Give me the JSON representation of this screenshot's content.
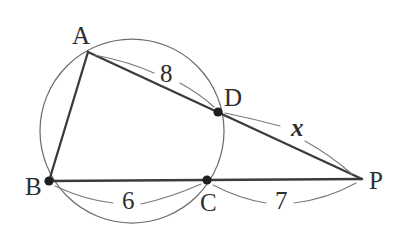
{
  "figure": {
    "background_color": "#ffffff",
    "line_color": "#3b3b3b",
    "circle_color": "#6d6d6d",
    "leader_color": "#7a7a7a",
    "dot_color": "#1f1f1f"
  },
  "circle": {
    "center_x": 132,
    "center_y": 131,
    "radius": 92
  },
  "points": [
    {
      "id": "A",
      "label": "A",
      "x": 88,
      "y": 52,
      "label_x": 72,
      "label_y": 44,
      "has_dot": false,
      "on_circle": true
    },
    {
      "id": "B",
      "label": "B",
      "x": 49,
      "y": 181,
      "label_x": 25,
      "label_y": 195,
      "has_dot": true,
      "on_circle": true
    },
    {
      "id": "C",
      "label": "C",
      "x": 207,
      "y": 180,
      "label_x": 200,
      "label_y": 211,
      "has_dot": true,
      "on_circle": true
    },
    {
      "id": "D",
      "label": "D",
      "x": 218,
      "y": 112,
      "label_x": 224,
      "label_y": 106,
      "has_dot": true,
      "on_circle": true
    },
    {
      "id": "P",
      "label": "P",
      "x": 362,
      "y": 179,
      "label_x": 369,
      "label_y": 189,
      "has_dot": false,
      "on_circle": false
    }
  ],
  "segments": [
    {
      "id": "AB",
      "from": "A",
      "to": "B",
      "x1": 88,
      "y1": 52,
      "x2": 49,
      "y2": 181
    },
    {
      "id": "AP",
      "from": "A",
      "to": "P",
      "x1": 88,
      "y1": 52,
      "x2": 362,
      "y2": 179
    },
    {
      "id": "BP",
      "from": "B",
      "to": "P",
      "x1": 49,
      "y1": 181,
      "x2": 362,
      "y2": 179
    }
  ],
  "measures": [
    {
      "id": "AD",
      "label": "8",
      "x": 160,
      "y": 82,
      "italic": false,
      "segment": "A to D"
    },
    {
      "id": "DP",
      "label": "x",
      "x": 291,
      "y": 136,
      "italic": true,
      "segment": "D to P"
    },
    {
      "id": "BC",
      "label": "6",
      "x": 122,
      "y": 209,
      "italic": false,
      "segment": "B to C"
    },
    {
      "id": "CP",
      "label": "7",
      "x": 275,
      "y": 209,
      "italic": false,
      "segment": "C to P"
    }
  ],
  "leader_arcs": [
    {
      "id": "arc-A-to-8",
      "d": "M 95 55 Q 130 62 154 73"
    },
    {
      "id": "arc-8-to-D",
      "d": "M 180 83 Q 200 94 214 107"
    },
    {
      "id": "arc-D-to-x",
      "d": "M 225 113 Q 254 119 280 126"
    },
    {
      "id": "arc-x-to-P",
      "d": "M 305 141 Q 330 155 352 174"
    },
    {
      "id": "arc-B-to-6",
      "d": "M 55 186 Q 85 200 113 203"
    },
    {
      "id": "arc-6-to-C",
      "d": "M 141 204 Q 172 197 201 184"
    },
    {
      "id": "arc-C-to-7",
      "d": "M 213 185 Q 240 199 266 203"
    },
    {
      "id": "arc-7-to-P",
      "d": "M 294 203 Q 327 199 356 183"
    }
  ]
}
